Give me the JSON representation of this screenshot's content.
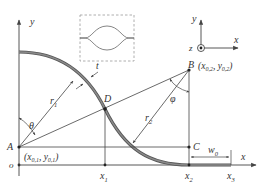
{
  "diagram": {
    "type": "geometry-schematic",
    "colors": {
      "line": "#444444",
      "curve": "#777777",
      "curve_edge": "#555555",
      "inset_border": "#999999",
      "text": "#333333"
    },
    "axes": {
      "y_label": "y",
      "x_label": "x",
      "origin_label": "o"
    },
    "points": {
      "A": {
        "label": "A",
        "coords": "(x_{0,1}, y_{0,1})",
        "coords_main": "(x",
        "coords_sub1": "0,1",
        "coords_mid": ", y",
        "coords_sub2": "0,1",
        "coords_end": ")"
      },
      "B": {
        "label": "B",
        "coords_main": "(x",
        "coords_sub1": "0,2",
        "coords_mid": ", y",
        "coords_sub2": "0,2",
        "coords_end": ")"
      },
      "C": {
        "label": "C"
      },
      "D": {
        "label": "D"
      }
    },
    "x_ticks": [
      {
        "base": "x",
        "sub": "1"
      },
      {
        "base": "x",
        "sub": "2"
      },
      {
        "base": "x",
        "sub": "3"
      }
    ],
    "dimensions": {
      "thickness": "t",
      "r1_base": "r",
      "r1_sub": "1",
      "r2_base": "r",
      "r2_sub": "2",
      "theta": "θ",
      "phi": "φ",
      "w0_base": "w",
      "w0_sub": "0"
    },
    "coordinate_system": {
      "x": "x",
      "y": "y",
      "z": "z"
    },
    "inset": {
      "description": "lens-shaped closed curve profile inside dashed box"
    }
  }
}
